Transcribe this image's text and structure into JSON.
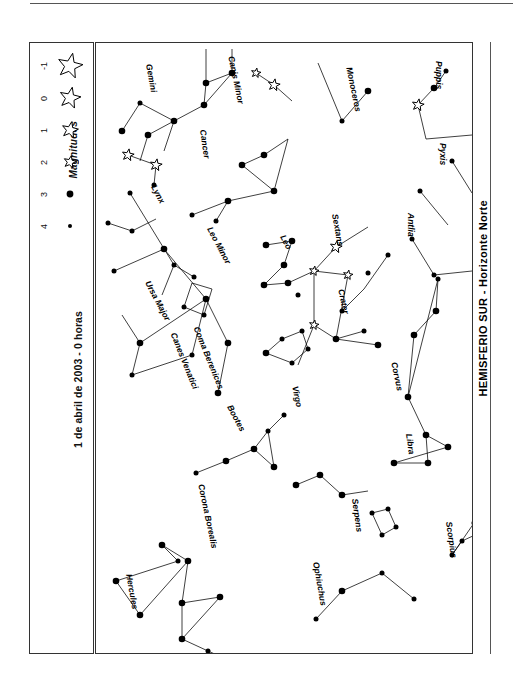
{
  "document": {
    "title": "HEMISFERIO SUR - Horizonte Norte",
    "date_caption": "1 de abril de 2003 - 0 horas"
  },
  "legend": {
    "heading": "Magnitudes",
    "rows": [
      {
        "magnitude": "-1",
        "symbol": "star",
        "size": 13
      },
      {
        "magnitude": "0",
        "symbol": "star",
        "size": 11
      },
      {
        "magnitude": "1",
        "symbol": "star",
        "size": 8.5
      },
      {
        "magnitude": "2",
        "symbol": "star",
        "size": 6.5
      },
      {
        "magnitude": "3",
        "symbol": "dot",
        "size": 3.4
      },
      {
        "magnitude": "4",
        "symbol": "dot",
        "size": 2.0
      }
    ]
  },
  "chart_data": {
    "type": "scatter",
    "title": "HEMISFERIO SUR - Horizonte Norte",
    "subtitle": "1 de abril de 2003 - 0 horas",
    "xlabel": "",
    "ylabel": "",
    "grid": false,
    "legend_position": "left-panel",
    "note": "Star chart (planisferio). Coordinates are panel-local pixels; magnitude drives glyph size.",
    "constellations": [
      {
        "name": "Puppis",
        "label": {
          "x": 348,
          "y": 18,
          "rot": 90
        }
      },
      {
        "name": "Pyxis",
        "label": {
          "x": 352,
          "y": 100,
          "rot": 90
        }
      },
      {
        "name": "Antlia",
        "label": {
          "x": 320,
          "y": 170,
          "rot": 90
        }
      },
      {
        "name": "Monoceros",
        "label": {
          "x": 258,
          "y": 23,
          "rot": 78
        }
      },
      {
        "name": "Canis Minor",
        "label": {
          "x": 140,
          "y": 12,
          "rot": 78
        }
      },
      {
        "name": "Gemini",
        "label": {
          "x": 58,
          "y": 20,
          "rot": 80
        }
      },
      {
        "name": "Cancer",
        "label": {
          "x": 112,
          "y": 86,
          "rot": 82
        }
      },
      {
        "name": "Lynx",
        "label": {
          "x": 62,
          "y": 140,
          "rot": 62
        }
      },
      {
        "name": "Leo Minor",
        "label": {
          "x": 118,
          "y": 182,
          "rot": 62
        }
      },
      {
        "name": "Leo",
        "label": {
          "x": 191,
          "y": 190,
          "rot": 62
        }
      },
      {
        "name": "Sextans",
        "label": {
          "x": 244,
          "y": 170,
          "rot": 80
        }
      },
      {
        "name": "Crater",
        "label": {
          "x": 250,
          "y": 245,
          "rot": 78
        }
      },
      {
        "name": "Corvus",
        "label": {
          "x": 303,
          "y": 318,
          "rot": 78
        }
      },
      {
        "name": "Ursa Major",
        "label": {
          "x": 56,
          "y": 236,
          "rot": 62
        }
      },
      {
        "name": "Coma Berenices",
        "label": {
          "x": 105,
          "y": 282,
          "rot": 68
        }
      },
      {
        "name": "Canes Venatici",
        "label": {
          "x": 82,
          "y": 288,
          "rot": 68
        }
      },
      {
        "name": "Virgo",
        "label": {
          "x": 204,
          "y": 342,
          "rot": 78
        }
      },
      {
        "name": "Bootes",
        "label": {
          "x": 138,
          "y": 360,
          "rot": 62
        }
      },
      {
        "name": "Libra",
        "label": {
          "x": 318,
          "y": 390,
          "rot": 82
        }
      },
      {
        "name": "Corona Borealis",
        "label": {
          "x": 110,
          "y": 440,
          "rot": 78
        }
      },
      {
        "name": "Serpens",
        "label": {
          "x": 264,
          "y": 455,
          "rot": 82
        }
      },
      {
        "name": "Hercules",
        "label": {
          "x": 38,
          "y": 530,
          "rot": 80
        }
      },
      {
        "name": "Ophiuchus",
        "label": {
          "x": 225,
          "y": 518,
          "rot": 80
        }
      },
      {
        "name": "Scorpius",
        "label": {
          "x": 358,
          "y": 478,
          "rot": 82
        }
      }
    ],
    "stars": [
      {
        "x": 350,
        "y": 28,
        "mag": 3
      },
      {
        "x": 338,
        "y": 45,
        "mag": 2
      },
      {
        "x": 322,
        "y": 62,
        "mag": 0
      },
      {
        "x": 356,
        "y": 118,
        "mag": 3
      },
      {
        "x": 324,
        "y": 148,
        "mag": 3
      },
      {
        "x": 316,
        "y": 196,
        "mag": 3
      },
      {
        "x": 338,
        "y": 232,
        "mag": 3
      },
      {
        "x": 272,
        "y": 48,
        "mag": 2
      },
      {
        "x": 246,
        "y": 78,
        "mag": 3
      },
      {
        "x": 178,
        "y": 42,
        "mag": 0
      },
      {
        "x": 160,
        "y": 30,
        "mag": 1
      },
      {
        "x": 136,
        "y": 30,
        "mag": 2
      },
      {
        "x": 110,
        "y": 40,
        "mag": 2
      },
      {
        "x": 108,
        "y": 62,
        "mag": 2
      },
      {
        "x": 78,
        "y": 78,
        "mag": 2
      },
      {
        "x": 52,
        "y": 92,
        "mag": 2
      },
      {
        "x": 44,
        "y": 60,
        "mag": 3
      },
      {
        "x": 26,
        "y": 88,
        "mag": 2
      },
      {
        "x": 32,
        "y": 112,
        "mag": 0
      },
      {
        "x": 60,
        "y": 122,
        "mag": 0
      },
      {
        "x": 58,
        "y": 142,
        "mag": 3
      },
      {
        "x": 146,
        "y": 122,
        "mag": 2
      },
      {
        "x": 168,
        "y": 112,
        "mag": 2
      },
      {
        "x": 132,
        "y": 158,
        "mag": 2
      },
      {
        "x": 120,
        "y": 178,
        "mag": 3
      },
      {
        "x": 96,
        "y": 172,
        "mag": 3
      },
      {
        "x": 178,
        "y": 148,
        "mag": 2
      },
      {
        "x": 12,
        "y": 180,
        "mag": 3
      },
      {
        "x": 36,
        "y": 188,
        "mag": 3
      },
      {
        "x": 34,
        "y": 150,
        "mag": 3
      },
      {
        "x": 78,
        "y": 222,
        "mag": 3
      },
      {
        "x": 98,
        "y": 234,
        "mag": 3
      },
      {
        "x": 88,
        "y": 264,
        "mag": 3
      },
      {
        "x": 108,
        "y": 272,
        "mag": 3
      },
      {
        "x": 170,
        "y": 202,
        "mag": 2
      },
      {
        "x": 196,
        "y": 198,
        "mag": 2
      },
      {
        "x": 188,
        "y": 222,
        "mag": 2
      },
      {
        "x": 168,
        "y": 242,
        "mag": 2
      },
      {
        "x": 192,
        "y": 240,
        "mag": 2
      },
      {
        "x": 218,
        "y": 228,
        "mag": 1
      },
      {
        "x": 240,
        "y": 204,
        "mag": 0
      },
      {
        "x": 252,
        "y": 232,
        "mag": 1
      },
      {
        "x": 218,
        "y": 282,
        "mag": 1
      },
      {
        "x": 240,
        "y": 296,
        "mag": 2
      },
      {
        "x": 268,
        "y": 288,
        "mag": 3
      },
      {
        "x": 282,
        "y": 302,
        "mag": 2
      },
      {
        "x": 202,
        "y": 252,
        "mag": 3
      },
      {
        "x": 246,
        "y": 268,
        "mag": 3
      },
      {
        "x": 272,
        "y": 230,
        "mag": 3
      },
      {
        "x": 292,
        "y": 212,
        "mag": 3
      },
      {
        "x": 18,
        "y": 228,
        "mag": 3
      },
      {
        "x": 68,
        "y": 206,
        "mag": 2
      },
      {
        "x": 110,
        "y": 256,
        "mag": 2
      },
      {
        "x": 132,
        "y": 300,
        "mag": 2
      },
      {
        "x": 122,
        "y": 350,
        "mag": 2
      },
      {
        "x": 44,
        "y": 300,
        "mag": 2
      },
      {
        "x": 36,
        "y": 332,
        "mag": 3
      },
      {
        "x": 96,
        "y": 312,
        "mag": 3
      },
      {
        "x": 170,
        "y": 310,
        "mag": 2
      },
      {
        "x": 186,
        "y": 296,
        "mag": 3
      },
      {
        "x": 206,
        "y": 288,
        "mag": 3
      },
      {
        "x": 212,
        "y": 306,
        "mag": 3
      },
      {
        "x": 196,
        "y": 320,
        "mag": 3
      },
      {
        "x": 100,
        "y": 430,
        "mag": 3
      },
      {
        "x": 130,
        "y": 418,
        "mag": 2
      },
      {
        "x": 158,
        "y": 406,
        "mag": 2
      },
      {
        "x": 178,
        "y": 424,
        "mag": 2
      },
      {
        "x": 172,
        "y": 388,
        "mag": 3
      },
      {
        "x": 188,
        "y": 372,
        "mag": 3
      },
      {
        "x": 318,
        "y": 292,
        "mag": 2
      },
      {
        "x": 340,
        "y": 268,
        "mag": 2
      },
      {
        "x": 342,
        "y": 236,
        "mag": 3
      },
      {
        "x": 312,
        "y": 354,
        "mag": 2
      },
      {
        "x": 330,
        "y": 392,
        "mag": 2
      },
      {
        "x": 332,
        "y": 420,
        "mag": 2
      },
      {
        "x": 298,
        "y": 420,
        "mag": 2
      },
      {
        "x": 352,
        "y": 404,
        "mag": 2
      },
      {
        "x": 200,
        "y": 442,
        "mag": 2
      },
      {
        "x": 224,
        "y": 432,
        "mag": 2
      },
      {
        "x": 246,
        "y": 452,
        "mag": 2
      },
      {
        "x": 276,
        "y": 470,
        "mag": 3
      },
      {
        "x": 292,
        "y": 466,
        "mag": 3
      },
      {
        "x": 300,
        "y": 484,
        "mag": 3
      },
      {
        "x": 286,
        "y": 492,
        "mag": 3
      },
      {
        "x": 378,
        "y": 480,
        "mag": 3
      },
      {
        "x": 392,
        "y": 486,
        "mag": 3
      },
      {
        "x": 366,
        "y": 498,
        "mag": 3
      },
      {
        "x": 356,
        "y": 512,
        "mag": 3
      },
      {
        "x": 66,
        "y": 502,
        "mag": 2
      },
      {
        "x": 82,
        "y": 518,
        "mag": 3
      },
      {
        "x": 20,
        "y": 538,
        "mag": 2
      },
      {
        "x": 44,
        "y": 572,
        "mag": 2
      },
      {
        "x": 92,
        "y": 518,
        "mag": 2
      },
      {
        "x": 86,
        "y": 560,
        "mag": 2
      },
      {
        "x": 124,
        "y": 554,
        "mag": 2
      },
      {
        "x": 86,
        "y": 596,
        "mag": 2
      },
      {
        "x": 112,
        "y": 608,
        "mag": 3
      },
      {
        "x": 148,
        "y": 624,
        "mag": 3
      },
      {
        "x": 160,
        "y": 646,
        "mag": 3
      },
      {
        "x": 246,
        "y": 548,
        "mag": 2
      },
      {
        "x": 286,
        "y": 530,
        "mag": 3
      },
      {
        "x": 318,
        "y": 556,
        "mag": 3
      },
      {
        "x": 220,
        "y": 576,
        "mag": 3
      }
    ]
  }
}
